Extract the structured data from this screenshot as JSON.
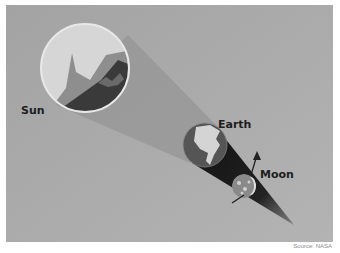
{
  "diagram": {
    "labels": {
      "sun": "Sun",
      "earth": "Earth",
      "moon": "Moon"
    },
    "source": "Source: NASA",
    "colors": {
      "background": "#a9a9a9",
      "sun_light": "#d4d4d4",
      "sun_dark": "#3a3a3a",
      "earth_ocean": "#5a5a5a",
      "earth_land": "#d8d8d8",
      "shadow": "#1a1a1a",
      "text": "#1e1e1e"
    }
  }
}
